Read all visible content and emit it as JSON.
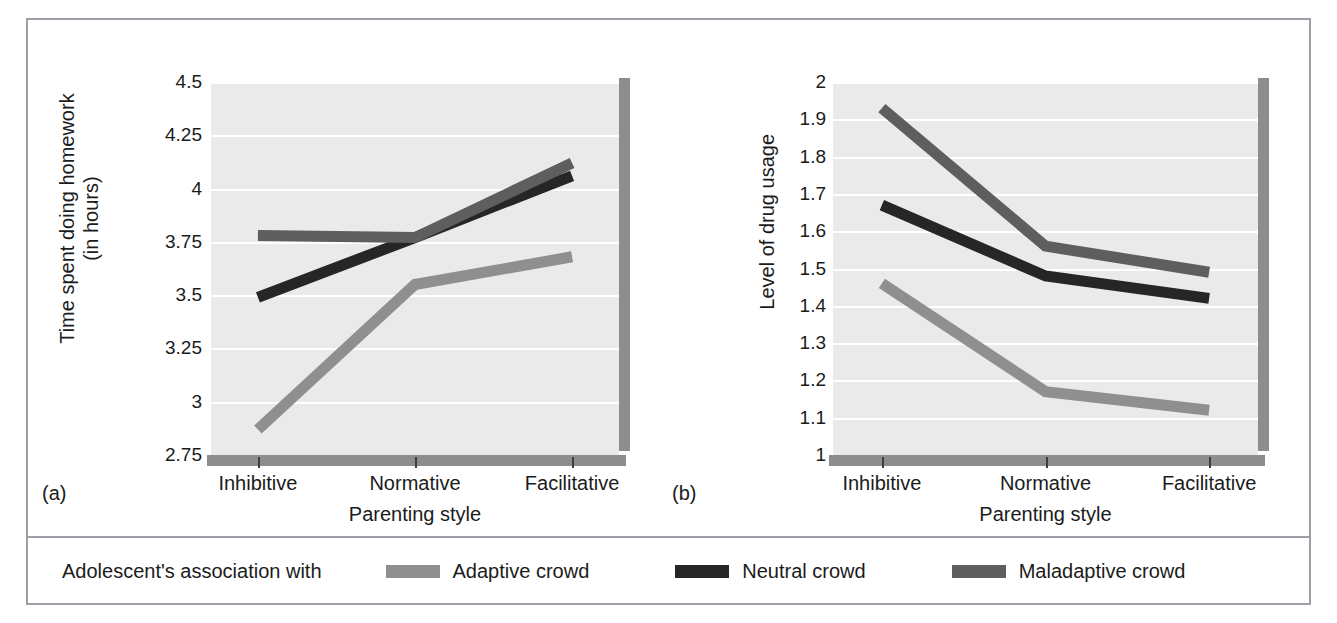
{
  "figure": {
    "panels": [
      {
        "tag": "(a)",
        "ytitle": "Time spent doing homework\n(in hours)",
        "xtitle": "Parenting style"
      },
      {
        "tag": "(b)",
        "ytitle": "Level of drug usage",
        "xtitle": "Parenting style"
      }
    ]
  },
  "legend": {
    "title": "Adolescent's association with",
    "items": [
      {
        "label": "Adaptive crowd",
        "color": "#8f8f8f"
      },
      {
        "label": "Neutral crowd",
        "color": "#262626"
      },
      {
        "label": "Maladaptive crowd",
        "color": "#5e5e5e"
      }
    ]
  },
  "colors": {
    "plot_background": "#eaeaea",
    "gridline": "#ffffff",
    "shadow": "#8d8d8d",
    "frame_border": "#9aa0a6",
    "text": "#1b1b1b",
    "adaptive": "#8f8f8f",
    "neutral": "#262626",
    "maladaptive": "#5e5e5e"
  },
  "chart_data": [
    {
      "type": "line",
      "title": "(a)",
      "xlabel": "Parenting style",
      "ylabel": "Time spent doing homework (in hours)",
      "categories": [
        "Inhibitive",
        "Normative",
        "Facilitative"
      ],
      "yticks": [
        "2.75",
        "3",
        "3.25",
        "3.5",
        "3.75",
        "4",
        "4.25",
        "4.5"
      ],
      "ylim": [
        2.75,
        4.5
      ],
      "grid": true,
      "legend_position": "bottom",
      "series": [
        {
          "name": "Adaptive crowd",
          "color": "#8f8f8f",
          "values": [
            2.87,
            3.55,
            3.68
          ]
        },
        {
          "name": "Neutral crowd",
          "color": "#262626",
          "values": [
            3.49,
            3.77,
            4.06
          ]
        },
        {
          "name": "Maladaptive crowd",
          "color": "#5e5e5e",
          "values": [
            3.78,
            3.77,
            4.12
          ]
        }
      ]
    },
    {
      "type": "line",
      "title": "(b)",
      "xlabel": "Parenting style",
      "ylabel": "Level of drug usage",
      "categories": [
        "Inhibitive",
        "Normative",
        "Facilitative"
      ],
      "yticks": [
        "1",
        "1.1",
        "1.2",
        "1.3",
        "1.4",
        "1.5",
        "1.6",
        "1.7",
        "1.8",
        "1.9",
        "2"
      ],
      "ylim": [
        1,
        2
      ],
      "grid": true,
      "legend_position": "bottom",
      "series": [
        {
          "name": "Adaptive crowd",
          "color": "#8f8f8f",
          "values": [
            1.46,
            1.17,
            1.12
          ]
        },
        {
          "name": "Neutral crowd",
          "color": "#262626",
          "values": [
            1.67,
            1.48,
            1.42
          ]
        },
        {
          "name": "Maladaptive crowd",
          "color": "#5e5e5e",
          "values": [
            1.93,
            1.56,
            1.49
          ]
        }
      ]
    }
  ]
}
